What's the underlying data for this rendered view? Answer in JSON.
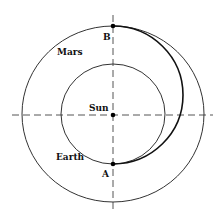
{
  "diagram": {
    "labels": {
      "mars": "Mars",
      "earth": "Earth",
      "sun": "Sun",
      "point_a": "A",
      "point_b": "B"
    },
    "colors": {
      "line": "#333333",
      "transfer": "#111111",
      "axes": "#555555",
      "background": "#ffffff"
    }
  }
}
